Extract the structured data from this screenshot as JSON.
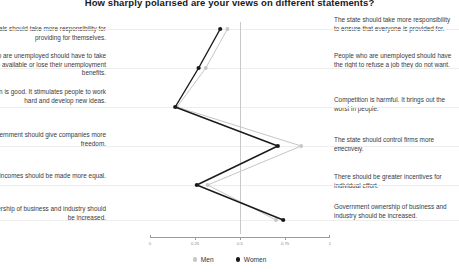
{
  "chart_data": {
    "type": "line",
    "title": "How sharply polarised are your views on different statements?",
    "orientation": "horizontal",
    "xlabel": "",
    "ylabel": "",
    "xlim": [
      0,
      1
    ],
    "xticks": [
      0,
      0.25,
      0.5,
      0.75,
      1
    ],
    "xtick_labels": [
      "0",
      "0.25",
      "0.5",
      "0.75",
      "1"
    ],
    "reference_line": 0.5,
    "grid": true,
    "legend_position": "bottom",
    "categories": [
      "statement-1",
      "statement-2",
      "statement-3",
      "statement-4",
      "statement-5",
      "statement-6"
    ],
    "left_labels": [
      "Individuals should take more responsibility for providing for themselves.",
      "People who are unemployed should have to take any job available or lose their unemployment benefits.",
      "Competition is good. It stimulates people to work hard and develop new ideas.",
      "The government should give companies more freedom.",
      "Incomes should be made more equal.",
      "Private ownership of business and industry should be increased."
    ],
    "right_labels": [
      "The state should take more responsibility to ensure that everyone is provided for.",
      "People who are unemployed should have the right to refuse a job they do not want.",
      "Competition is harmful. It brings out the worst in people.",
      "The state should control firms more effectively.",
      "There should be greater incentives for individual effort.",
      "Government ownership of business and industry should be increased."
    ],
    "series": [
      {
        "name": "Men",
        "color": "#c6c6c6",
        "values": [
          0.43,
          0.31,
          0.15,
          0.84,
          0.32,
          0.7
        ]
      },
      {
        "name": "Women",
        "color": "#1a1a1a",
        "values": [
          0.39,
          0.27,
          0.14,
          0.71,
          0.26,
          0.74
        ]
      }
    ]
  },
  "legend": {
    "men_label": "Men",
    "women_label": "Women"
  },
  "colors": {
    "men": "#c6c6c6",
    "women": "#1a1a1a",
    "grid": "#ededed",
    "reference": "#c9c9c9",
    "axis": "#9a9a9a"
  }
}
